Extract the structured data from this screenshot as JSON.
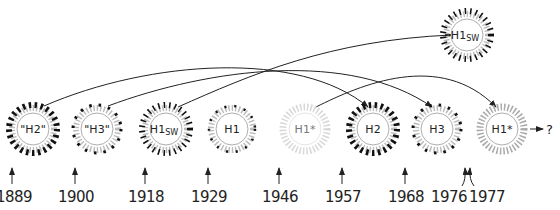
{
  "diagram": {
    "type": "influenza-subtype-timeline",
    "viruses": [
      {
        "id": "v1",
        "label": "\"H2\"",
        "sub": "",
        "pattern": "bars-heavy",
        "cx": 33,
        "cy": 129
      },
      {
        "id": "v2",
        "label": "\"H3\"",
        "sub": "",
        "pattern": "dots",
        "cx": 97,
        "cy": 129
      },
      {
        "id": "v3",
        "label": "H1",
        "sub": "SW",
        "pattern": "bars-medium",
        "cx": 166,
        "cy": 129
      },
      {
        "id": "v4",
        "label": "H1",
        "sub": "",
        "pattern": "dots-light",
        "cx": 232,
        "cy": 129
      },
      {
        "id": "v5",
        "label": "H1*",
        "sub": "",
        "pattern": "faint",
        "cx": 305,
        "cy": 129
      },
      {
        "id": "v6",
        "label": "H2",
        "sub": "",
        "pattern": "bars-heavy",
        "cx": 373,
        "cy": 129
      },
      {
        "id": "v7",
        "label": "H3",
        "sub": "",
        "pattern": "dots",
        "cx": 437,
        "cy": 129
      },
      {
        "id": "v8",
        "label": "H1*",
        "sub": "",
        "pattern": "plain",
        "cx": 502,
        "cy": 129
      },
      {
        "id": "v9",
        "label": "H1",
        "sub": "SW",
        "pattern": "bars-medium",
        "cx": 467,
        "cy": 35
      }
    ],
    "years": [
      {
        "label": "1889",
        "x": 13,
        "arrow_x": 12
      },
      {
        "label": "1900",
        "x": 73,
        "arrow_x": 75
      },
      {
        "label": "1918",
        "x": 145,
        "arrow_x": 145
      },
      {
        "label": "1929",
        "x": 207,
        "arrow_x": 208
      },
      {
        "label": "1946",
        "x": 280,
        "arrow_x": 279
      },
      {
        "label": "1957",
        "x": 342,
        "arrow_x": 342
      },
      {
        "label": "1968",
        "x": 404,
        "arrow_x": 405
      },
      {
        "label": "1976",
        "x": 467,
        "arrow_x": 465
      },
      {
        "label": "1977",
        "x": 515,
        "arrow_x": 469
      }
    ],
    "outcome_label": "?",
    "links": [
      {
        "from": "\"H2\"",
        "to": "H2"
      },
      {
        "from": "\"H3\"",
        "to": "H3"
      },
      {
        "from": "H1sw (1918)",
        "to": "H1sw (1976)"
      },
      {
        "from": "H1* (1946)",
        "to": "H1* (1977)"
      }
    ]
  }
}
